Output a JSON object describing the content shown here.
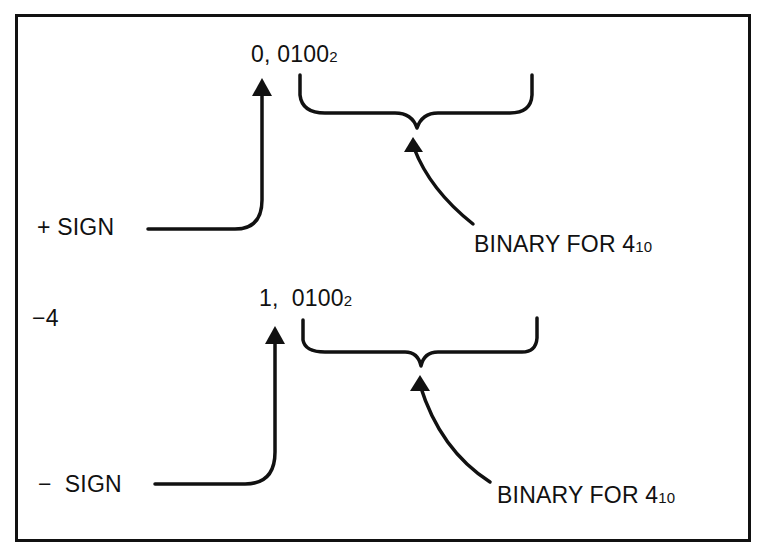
{
  "diagram": {
    "title": "",
    "positive_example": {
      "sign_bit": "0,",
      "magnitude_bits": "0100",
      "magnitude_base": "2",
      "sign_label": "+ SIGN",
      "magnitude_label": "BINARY FOR 4",
      "magnitude_label_base": "10"
    },
    "negative_example": {
      "value_label": "−4",
      "sign_bit": "1,",
      "magnitude_bits": "0100",
      "magnitude_base": "2",
      "sign_label": "−  SIGN",
      "magnitude_label": "BINARY FOR 4",
      "magnitude_label_base": "10"
    },
    "colors": {
      "ink": "#111111",
      "background": "#ffffff"
    }
  }
}
